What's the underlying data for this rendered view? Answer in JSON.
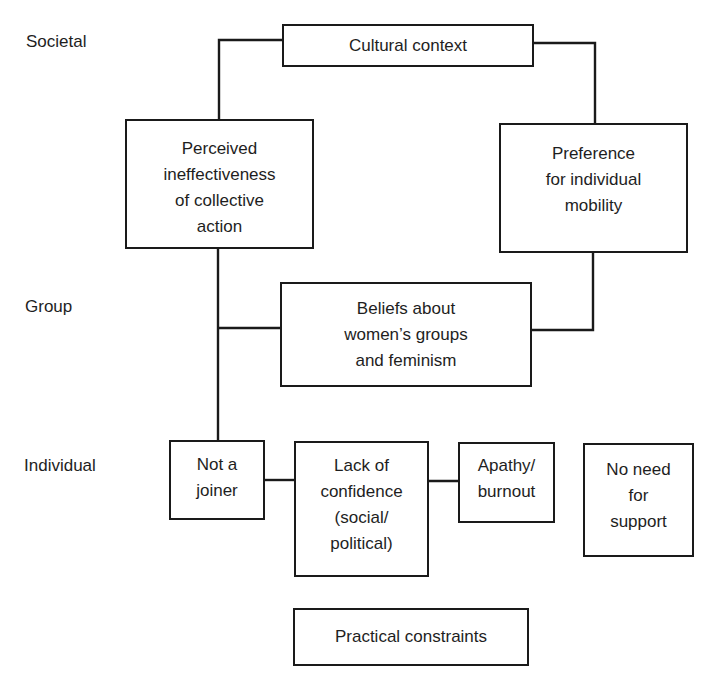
{
  "levels": {
    "societal": "Societal",
    "group": "Group",
    "individual": "Individual"
  },
  "nodes": {
    "cultural_context": "Cultural context",
    "perceived_ineffectiveness": "Perceived\nineffectiveness\nof collective\naction",
    "preference_mobility": "Preference\nfor individual\nmobility",
    "beliefs_feminism": "Beliefs about\nwomen’s groups\nand feminism",
    "not_a_joiner": "Not a\njoiner",
    "lack_of_confidence": "Lack of\nconfidence\n(social/\npolitical)",
    "apathy_burnout": "Apathy/\nburnout",
    "no_need_support": "No need\nfor\nsupport",
    "practical_constraints": "Practical constraints"
  },
  "edges": [
    {
      "from": "cultural_context",
      "to": "perceived_ineffectiveness"
    },
    {
      "from": "cultural_context",
      "to": "preference_mobility"
    },
    {
      "from": "preference_mobility",
      "to": "beliefs_feminism"
    },
    {
      "from": "perceived_ineffectiveness",
      "to": "beliefs_feminism"
    },
    {
      "from": "perceived_ineffectiveness",
      "to": "not_a_joiner"
    },
    {
      "from": "not_a_joiner",
      "to": "lack_of_confidence"
    },
    {
      "from": "lack_of_confidence",
      "to": "apathy_burnout"
    }
  ],
  "colors": {
    "line": "#1a1a1a",
    "text": "#1e1e1e",
    "background": "#ffffff"
  }
}
